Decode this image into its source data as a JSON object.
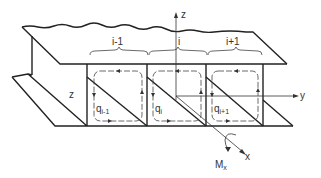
{
  "figure": {
    "axes": {
      "z_label": "z",
      "y_label": "y",
      "x_label": "x"
    },
    "cells": [
      {
        "brace_label": "i-1",
        "flow_label": "q",
        "flow_sub": "i-1"
      },
      {
        "brace_label": "i",
        "flow_label": "q",
        "flow_sub": "i"
      },
      {
        "brace_label": "i+1",
        "flow_label": "q",
        "flow_sub": "i+1"
      }
    ],
    "left_label": "z",
    "moment_label": "M",
    "moment_sub": "x",
    "colors": {
      "line": "#222222",
      "thin": "#444444",
      "text": "#333333"
    }
  }
}
